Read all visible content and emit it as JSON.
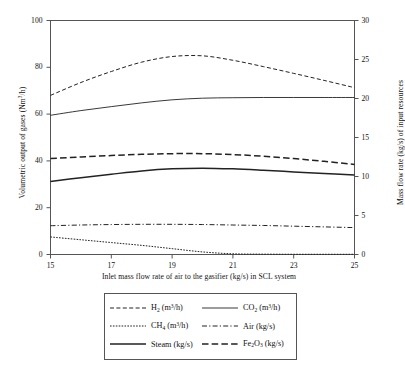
{
  "chart_data": {
    "type": "line",
    "title": "",
    "xlabel": "Inlet mass flow rate of air to the gasifier (kg/s) in SCL system",
    "ylabel": "Volumetric output of gases (Nm3/h)",
    "ylabel_right": "Mass flow rate (kg/s) of input resources",
    "xlim": [
      15,
      25
    ],
    "ylim": [
      0,
      100
    ],
    "ylim_right": [
      0,
      30
    ],
    "xticks": [
      15,
      17,
      19,
      21,
      23,
      25
    ],
    "yticks": [
      0,
      20,
      40,
      60,
      80,
      100
    ],
    "yticks_right": [
      0,
      5,
      10,
      15,
      20,
      25,
      30
    ],
    "grid": false,
    "legend_position": "below-center",
    "x": [
      15,
      16,
      17,
      18,
      19,
      20,
      21,
      22,
      23,
      24,
      25
    ],
    "series": [
      {
        "name": "H2 (m3/h)",
        "axis": "left",
        "style": "dashed",
        "values": [
          68.0,
          73.5,
          78.2,
          82.2,
          84.6,
          84.9,
          83.0,
          80.3,
          77.4,
          74.4,
          71.3
        ]
      },
      {
        "name": "CO2 (m3/h)",
        "axis": "left",
        "style": "solid-thin",
        "values": [
          59.5,
          61.5,
          63.2,
          64.8,
          66.1,
          66.8,
          67.0,
          67.1,
          67.1,
          67.1,
          67.1
        ]
      },
      {
        "name": "CH4 (m3/h)",
        "axis": "left",
        "style": "dotted",
        "values": [
          7.5,
          6.3,
          5.1,
          3.9,
          2.5,
          1.1,
          0.3,
          0.15,
          0.1,
          0.1,
          0.1
        ]
      },
      {
        "name": "Air (kg/s)",
        "axis": "left",
        "style": "dash-dot",
        "values": [
          12.3,
          12.6,
          12.8,
          12.9,
          12.9,
          12.8,
          12.6,
          12.4,
          12.1,
          11.8,
          11.5
        ]
      },
      {
        "name": "Steam (kg/s)",
        "axis": "left",
        "style": "solid-thick",
        "values": [
          31.2,
          32.8,
          34.3,
          35.7,
          36.6,
          36.9,
          36.6,
          36.0,
          35.3,
          34.6,
          34.0
        ]
      },
      {
        "name": "Fe2O3 (kg/s)",
        "axis": "left",
        "style": "long-dashed",
        "values": [
          41.0,
          41.7,
          42.3,
          42.8,
          43.1,
          43.1,
          42.7,
          42.0,
          41.0,
          39.8,
          38.5
        ]
      }
    ]
  },
  "axes": {
    "left_title_prefix": "Volumetric output of gases (Nm",
    "left_title_sup": "3",
    "left_title_suffix": "/h)",
    "right_title": "Mass flow rate (kg/s) of input resources",
    "x_title": "Inlet mass flow rate of air to the gasifier (kg/s) in SCL system"
  },
  "legend": {
    "entries": [
      {
        "id": "h2",
        "base": "H",
        "sub": "2",
        "unit_pre": " (m",
        "unit_sup": "3",
        "unit_post": "/h)",
        "style": "dashed"
      },
      {
        "id": "co2",
        "base": "CO",
        "sub": "2",
        "unit_pre": " (m",
        "unit_sup": "3",
        "unit_post": "/h)",
        "style": "solid-thin"
      },
      {
        "id": "ch4",
        "base": "CH",
        "sub": "4",
        "unit_pre": " (m",
        "unit_sup": "3",
        "unit_post": "/h)",
        "style": "dotted"
      },
      {
        "id": "air",
        "base": "Air",
        "sub": "",
        "unit_pre": " (kg/s)",
        "unit_sup": "",
        "unit_post": "",
        "style": "dash-dot"
      },
      {
        "id": "steam",
        "base": "Steam",
        "sub": "",
        "unit_pre": " (kg/s)",
        "unit_sup": "",
        "unit_post": "",
        "style": "solid-thick"
      },
      {
        "id": "fe2o3",
        "base": "Fe",
        "sub": "2",
        "base2": "O",
        "sub2": "3",
        "unit_pre": " (kg/s)",
        "unit_sup": "",
        "unit_post": "",
        "style": "long-dashed"
      }
    ]
  },
  "colors": {
    "line": "#222222",
    "frame": "#555555",
    "text": "#111111",
    "background": "#ffffff"
  }
}
